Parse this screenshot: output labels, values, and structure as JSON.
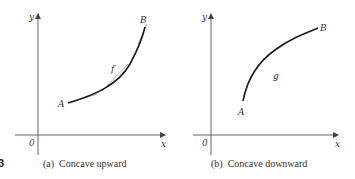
{
  "figure_number_fragment": "3",
  "panels": [
    {
      "id": "a",
      "caption": "(a)  Concave upward",
      "axis_x_label": "x",
      "axis_y_label": "y",
      "origin_label": "0",
      "point_start_label": "A",
      "point_end_label": "B",
      "curve_label": "f",
      "concavity": "upward",
      "has_tangent_lines": true
    },
    {
      "id": "b",
      "caption": "(b)  Concave downward",
      "axis_x_label": "x",
      "axis_y_label": "y",
      "origin_label": "0",
      "point_start_label": "A",
      "point_end_label": "B",
      "curve_label": "g",
      "concavity": "downward",
      "has_tangent_lines": false
    }
  ],
  "colors": {
    "curve": "#1a1a1a",
    "axis": "#555555",
    "tangent": "#888888",
    "text": "#333333"
  }
}
